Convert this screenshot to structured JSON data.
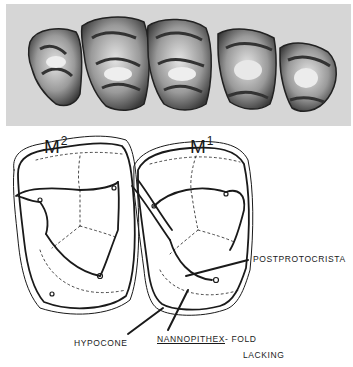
{
  "figure": {
    "photo": {
      "description": "Photographic illustration of five upper teeth in occlusal view",
      "tooth_count": 5,
      "background_color": "#d6d6d6"
    },
    "labels": {
      "m2": {
        "base": "M",
        "superscript": "2"
      },
      "m1": {
        "base": "M",
        "superscript": "1"
      }
    },
    "annotations": {
      "postprotocrista": "POSTPROTOCRISTA",
      "hypocone": "HYPOCONE",
      "nannopithex_term": "NANNOPITHEX",
      "fold_suffix": "- FOLD",
      "lacking": "LACKING"
    },
    "colors": {
      "ink": "#1a1a1a",
      "paper": "#ffffff",
      "photo_bg": "#d6d6d6"
    }
  }
}
